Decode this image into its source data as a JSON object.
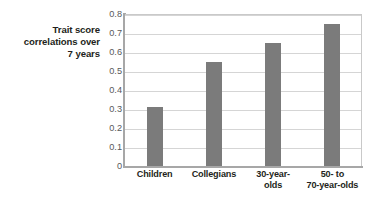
{
  "chart_data": {
    "type": "bar",
    "title": "",
    "xlabel": "",
    "ylabel": "Trait score correlations over 7 years",
    "ylabel_lines": [
      "Trait score",
      "correlations over",
      "7 years"
    ],
    "categories": [
      "Children",
      "Collegians",
      "30-year-olds",
      "50- to 70-year-olds"
    ],
    "category_lines": [
      [
        "Children"
      ],
      [
        "Collegians"
      ],
      [
        "30-year-",
        "olds"
      ],
      [
        "50- to",
        "70-year-olds"
      ]
    ],
    "values": [
      0.31,
      0.545,
      0.65,
      0.75
    ],
    "ylim": [
      0,
      0.8
    ],
    "ytick_labels": [
      "0.8",
      "0.7",
      "0.6",
      "0.5",
      "0.4",
      "0.3",
      "0.2",
      "0.1",
      "0"
    ],
    "ytick_values": [
      0.8,
      0.7,
      0.6,
      0.5,
      0.4,
      0.3,
      0.2,
      0.1,
      0
    ],
    "grid": true,
    "legend": "none",
    "bar_color": "#7b7b7b",
    "gridline_color": "#d5d5d5",
    "axis_color": "#a7a7a7",
    "background_color": "#ffffff",
    "text_color": "#231f20"
  }
}
